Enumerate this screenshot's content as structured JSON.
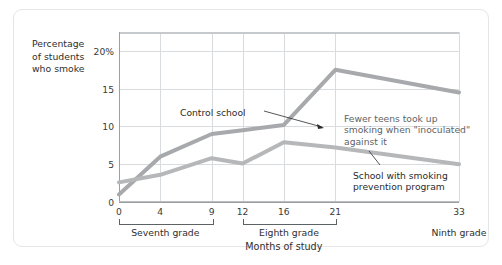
{
  "figure": {
    "y_axis_title_lines": [
      "Percentage",
      "of students",
      "who smoke"
    ],
    "x_axis_title": "Months of study"
  },
  "annotations": {
    "control": "Control school",
    "inoculated_lines": [
      "Fewer teens took up",
      "smoking when \"inoculated\"",
      "against it"
    ],
    "program_lines": [
      "School with smoking",
      "prevention program"
    ]
  },
  "grade_groups": [
    {
      "label": "Seventh grade",
      "start": 0,
      "end": 9
    },
    {
      "label": "Eighth grade",
      "start": 12,
      "end": 21
    },
    {
      "label": "Ninth grade",
      "start": 33,
      "end": 33
    }
  ],
  "colors": {
    "control_line": "#a7a9ac",
    "program_line": "#b5b7b9",
    "grid": "#d9dcde",
    "axis": "#9aa0a4",
    "text": "#2b2b2b",
    "frame": "#e4e6e8"
  },
  "chart_data": {
    "type": "line",
    "title": "",
    "xlabel": "Months of study",
    "ylabel": "Percentage of students who smoke",
    "x": [
      0,
      4,
      9,
      12,
      16,
      21,
      33
    ],
    "xtick_labels": [
      "0",
      "4",
      "9",
      "12",
      "16",
      "21",
      "33"
    ],
    "ytick_labels": [
      "0",
      "5",
      "10",
      "15",
      "20%"
    ],
    "yticks": [
      0,
      5,
      10,
      15,
      20
    ],
    "xlim": [
      0,
      33
    ],
    "ylim": [
      0,
      22.5
    ],
    "grid": true,
    "legend": "annotations",
    "series": [
      {
        "name": "Control school",
        "values": [
          1.0,
          6.0,
          9.0,
          9.5,
          10.2,
          17.5,
          14.5
        ]
      },
      {
        "name": "School with smoking prevention program",
        "values": [
          2.6,
          3.6,
          5.8,
          5.1,
          7.9,
          7.2,
          5.0
        ]
      }
    ]
  }
}
